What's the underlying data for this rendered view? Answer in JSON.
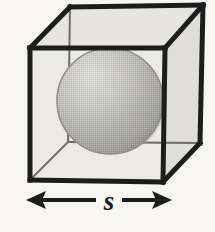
{
  "figure": {
    "background_color": "#f7f6f3",
    "stroke_color": "#1f1f1f",
    "caption": ""
  },
  "cube": {
    "name": "cube",
    "description": "Wireframe cube drawn in oblique projection with visible interior",
    "edge_color": "#1d1d1d",
    "edge_width": 5,
    "hidden_edge_width": 2,
    "front_face_fill": "#e9e8e4",
    "top_face_fill": "#e3e2de",
    "right_face_fill": "#dedcd8",
    "vertices": {
      "front_top_left": [
        30,
        48
      ],
      "front_top_right": [
        165,
        48
      ],
      "front_bottom_right": [
        163,
        182
      ],
      "front_bottom_left": [
        30,
        180
      ],
      "back_top_left": [
        70,
        7
      ],
      "back_top_right": [
        203,
        5
      ],
      "back_bottom_right": [
        200,
        143
      ],
      "back_bottom_left": [
        68,
        142
      ]
    }
  },
  "sphere": {
    "name": "inscribed-sphere",
    "center": [
      110,
      101
    ],
    "radius": 53,
    "fill_light": "#d2d1cd",
    "fill_mid": "#b7b6b1",
    "fill_dark": "#9b9a95",
    "outline_color": "#8d8c87",
    "shading": "halftone gradient, highlight upper-left"
  },
  "dimension": {
    "name": "side-length-dimension",
    "label": "s",
    "label_meaning": "side length of cube",
    "y": 200,
    "x_start": 28,
    "x_end": 170,
    "arrow_color": "#1c1c1c",
    "line_width": 4,
    "double_headed": true
  }
}
